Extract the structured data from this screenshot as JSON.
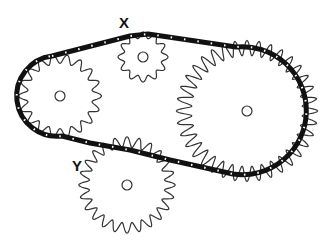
{
  "diagram": {
    "type": "chain-drive",
    "labels": {
      "x": "X",
      "y": "Y"
    },
    "colors": {
      "chain": "#111111",
      "gear_outline": "#333333",
      "background": "#ffffff"
    },
    "gears": [
      {
        "id": "left-sprocket",
        "cx": 60,
        "cy": 96,
        "r": 37,
        "teeth": 18
      },
      {
        "id": "gear-x",
        "label": "X",
        "cx": 143,
        "cy": 57,
        "r": 22,
        "teeth": 12
      },
      {
        "id": "large-sprocket",
        "cx": 247,
        "cy": 111,
        "r": 63,
        "teeth": 36
      },
      {
        "id": "gear-y",
        "label": "Y",
        "cx": 127,
        "cy": 185,
        "r": 43,
        "teeth": 24
      }
    ]
  }
}
